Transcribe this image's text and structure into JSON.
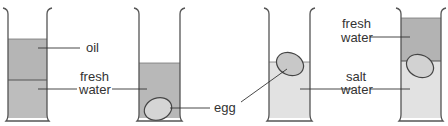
{
  "diagram": {
    "colors": {
      "outline": "#555555",
      "dark_liquid": "#b3b3b3",
      "light_liquid": "#e4e4e4",
      "egg_fill": "#c8c8c8",
      "egg_outline": "#444444",
      "text": "#333333"
    },
    "beakers": [
      {
        "id": 1,
        "layers": [
          "oil",
          "fresh water"
        ],
        "egg": "none"
      },
      {
        "id": 2,
        "layers": [
          "fresh water"
        ],
        "egg": "bottom"
      },
      {
        "id": 3,
        "layers": [
          "salt water"
        ],
        "egg": "floating at surface"
      },
      {
        "id": 4,
        "layers": [
          "fresh water",
          "salt water"
        ],
        "egg": "at interface"
      }
    ],
    "labels": {
      "oil": "oil",
      "fresh_water_1_line1": "fresh",
      "fresh_water_1_line2": "water",
      "egg": "egg",
      "salt_water_line1": "salt",
      "salt_water_line2": "water",
      "fresh_water_2_line1": "fresh",
      "fresh_water_2_line2": "water"
    }
  }
}
